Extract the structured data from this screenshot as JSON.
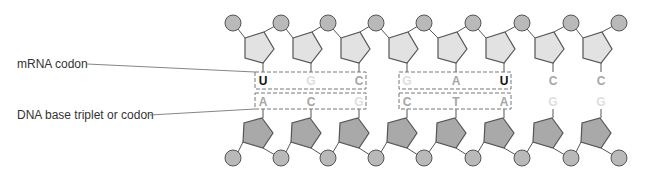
{
  "labels": {
    "mrna": "mRNA codon",
    "dna": "DNA base triplet or codon"
  },
  "colors": {
    "circle_fill": "#b9b9b9",
    "top_pentagon_fill": "#e2e2e2",
    "bottom_pentagon_fill": "#a9a9a9",
    "stroke": "#555555",
    "box_stroke": "#777777",
    "letter_strong": "#111111",
    "letter_mid": "#a6a6a6",
    "letter_faint": "#dedede"
  },
  "mrna_strand": {
    "bases": [
      {
        "letter": "U",
        "tone": "strong"
      },
      {
        "letter": "G",
        "tone": "faint"
      },
      {
        "letter": "C",
        "tone": "mid"
      },
      {
        "letter": "G",
        "tone": "faint"
      },
      {
        "letter": "A",
        "tone": "mid"
      },
      {
        "letter": "U",
        "tone": "strong"
      },
      {
        "letter": "C",
        "tone": "mid"
      },
      {
        "letter": "C",
        "tone": "mid"
      }
    ]
  },
  "dna_strand": {
    "bases": [
      {
        "letter": "A",
        "tone": "mid"
      },
      {
        "letter": "C",
        "tone": "mid"
      },
      {
        "letter": "G",
        "tone": "faint"
      },
      {
        "letter": "C",
        "tone": "mid"
      },
      {
        "letter": "T",
        "tone": "mid"
      },
      {
        "letter": "A",
        "tone": "mid"
      },
      {
        "letter": "G",
        "tone": "faint"
      },
      {
        "letter": "G",
        "tone": "faint"
      }
    ]
  },
  "codon_boxes": [
    {
      "name": "codon-1",
      "start_index": 0,
      "end_index": 2
    },
    {
      "name": "codon-2",
      "start_index": 3,
      "end_index": 5
    }
  ]
}
